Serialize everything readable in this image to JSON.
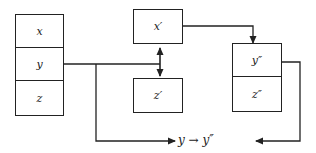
{
  "diagram": {
    "left_stack": {
      "cells": [
        {
          "label": "x"
        },
        {
          "label": "y"
        },
        {
          "label": "z"
        }
      ]
    },
    "middle": {
      "top_box": {
        "label": "x′"
      },
      "bottom_box": {
        "label": "z′"
      }
    },
    "right_stack": {
      "cells": [
        {
          "label": "y″"
        },
        {
          "label": "z″"
        }
      ]
    },
    "result_label": "y → y″",
    "colors": {
      "stroke": "#222222",
      "background": "#ffffff"
    }
  }
}
